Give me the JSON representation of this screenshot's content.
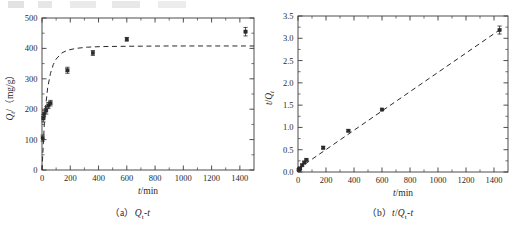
{
  "figure": {
    "panels": [
      {
        "key": "a",
        "caption_prefix": "（a）",
        "caption_body": "Qt-t",
        "xlabel": "t/min",
        "ylabel": "Qt/（mg/g）"
      },
      {
        "key": "b",
        "caption_prefix": "（b）",
        "caption_body": "t/Qt-t",
        "xlabel": "t/min",
        "ylabel": "t/Qt"
      }
    ]
  },
  "chart_data": [
    {
      "type": "scatter",
      "panel": "a",
      "title": "",
      "xlabel": "t/min",
      "ylabel": "Qt/（mg/g）",
      "xlim": [
        0,
        1500
      ],
      "ylim": [
        0,
        500
      ],
      "xticks": [
        0,
        200,
        400,
        600,
        800,
        1000,
        1200,
        1400
      ],
      "xticklabels": [
        "0",
        "200",
        "400",
        "600",
        "800",
        "1000",
        "1200",
        "1400"
      ],
      "yticks": [
        0,
        100,
        200,
        300,
        400,
        500
      ],
      "yticklabels": [
        "0",
        "100",
        "200",
        "300",
        "400",
        "500"
      ],
      "grid": false,
      "legend": null,
      "series": [
        {
          "name": "Qt measured",
          "marker": "square",
          "errorbars": true,
          "x": [
            5,
            10,
            15,
            30,
            45,
            60,
            180,
            360,
            600,
            1440
          ],
          "y": [
            105,
            170,
            185,
            196,
            212,
            220,
            328,
            385,
            430,
            455
          ],
          "yerr": [
            10,
            12,
            10,
            12,
            10,
            9,
            10,
            8,
            6,
            14
          ]
        },
        {
          "name": "pseudo-second-order fit",
          "style": "dashed-curve",
          "x": [
            0,
            20,
            40,
            60,
            80,
            100,
            140,
            180,
            240,
            320,
            420,
            600,
            900,
            1200,
            1440,
            1500
          ],
          "y": [
            0,
            185,
            270,
            318,
            347,
            365,
            385,
            394,
            400,
            404,
            406,
            407,
            408,
            408,
            408,
            408
          ]
        }
      ]
    },
    {
      "type": "scatter",
      "panel": "b",
      "title": "",
      "xlabel": "t/min",
      "ylabel": "t/Qt",
      "xlim": [
        0,
        1500
      ],
      "ylim": [
        0.0,
        3.5
      ],
      "xticks": [
        0,
        200,
        400,
        600,
        800,
        1000,
        1200,
        1400
      ],
      "xticklabels": [
        "0",
        "200",
        "400",
        "600",
        "800",
        "1000",
        "1200",
        "1400"
      ],
      "yticks": [
        0.0,
        0.5,
        1.0,
        1.5,
        2.0,
        2.5,
        3.0,
        3.5
      ],
      "yticklabels": [
        "0.0",
        "0.5",
        "1.0",
        "1.5",
        "2.0",
        "2.5",
        "3.0",
        "3.5"
      ],
      "grid": false,
      "legend": null,
      "series": [
        {
          "name": "t/Qt measured",
          "marker": "square",
          "errorbars": true,
          "x": [
            5,
            10,
            15,
            30,
            45,
            60,
            180,
            360,
            600,
            1440
          ],
          "y": [
            0.048,
            0.059,
            0.081,
            0.153,
            0.212,
            0.273,
            0.545,
            0.925,
            1.4,
            3.185
          ],
          "yerr": [
            0.02,
            0.02,
            0.02,
            0.02,
            0.02,
            0.02,
            0.03,
            0.02,
            0.02,
            0.09
          ]
        },
        {
          "name": "linear fit",
          "style": "dashed-line",
          "x": [
            0,
            1450
          ],
          "y": [
            0.07,
            3.21
          ]
        }
      ]
    }
  ]
}
